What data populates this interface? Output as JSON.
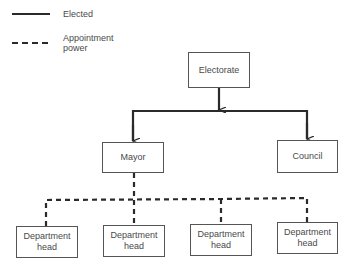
{
  "legend": {
    "items": [
      {
        "style": "solid",
        "label": "Elected"
      },
      {
        "style": "dashed",
        "label_line1": "Appointment",
        "label_line2": "power"
      }
    ]
  },
  "nodes": {
    "electorate": "Electorate",
    "mayor": "Mayor",
    "council": "Council",
    "departments": [
      {
        "line1": "Department",
        "line2": "head"
      },
      {
        "line1": "Department",
        "line2": "head"
      },
      {
        "line1": "Department",
        "line2": "head"
      },
      {
        "line1": "Department",
        "line2": "head"
      }
    ]
  },
  "edges": [
    {
      "from": "Electorate",
      "to": "Mayor",
      "type": "elected"
    },
    {
      "from": "Electorate",
      "to": "Council",
      "type": "elected"
    },
    {
      "from": "Mayor",
      "to": "Department head 1",
      "type": "appointment"
    },
    {
      "from": "Mayor",
      "to": "Department head 2",
      "type": "appointment"
    },
    {
      "from": "Mayor",
      "to": "Department head 3",
      "type": "appointment"
    },
    {
      "from": "Mayor",
      "to": "Department head 4",
      "type": "appointment"
    }
  ],
  "colors": {
    "line": "#2a2a2a",
    "box_border": "#555555",
    "text": "#4a4a4a"
  }
}
